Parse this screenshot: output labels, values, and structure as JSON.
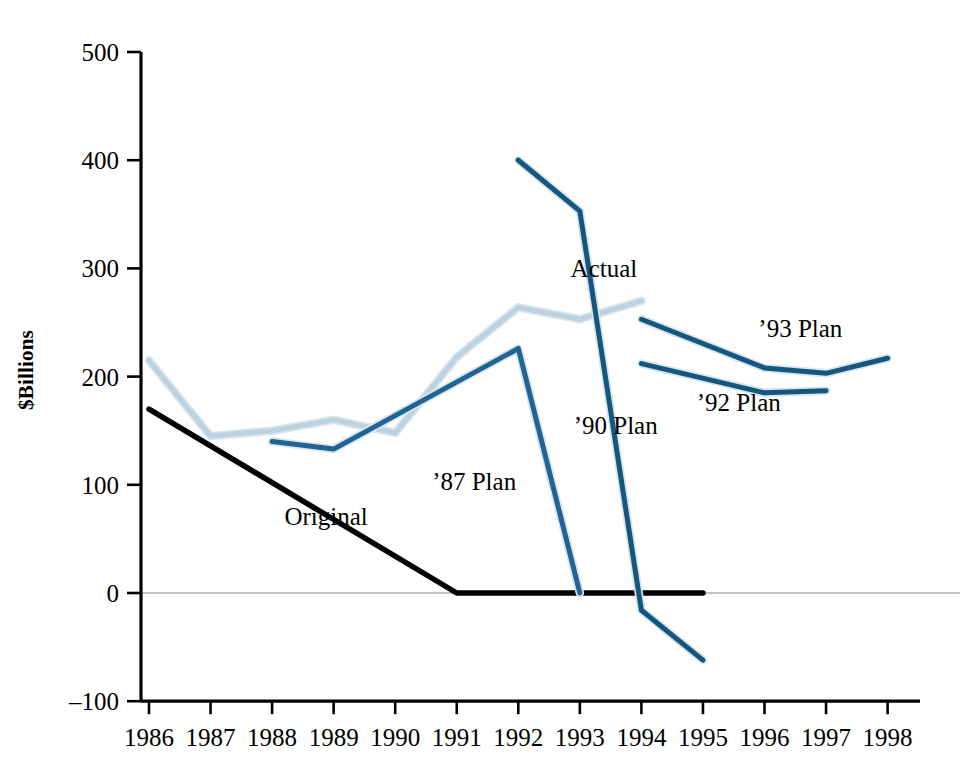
{
  "chart_data": {
    "type": "line",
    "title": "",
    "xlabel": "",
    "ylabel": "$Billions",
    "xlim": [
      1986,
      1998
    ],
    "ylim": [
      -100,
      500
    ],
    "yticks": [
      500,
      400,
      300,
      200,
      100,
      0,
      -100
    ],
    "ytick_labels": [
      "500",
      "400",
      "300",
      "200",
      "100",
      "0",
      "–100"
    ],
    "xticks": [
      1986,
      1987,
      1988,
      1989,
      1990,
      1991,
      1992,
      1993,
      1994,
      1995,
      1996,
      1997,
      1998
    ],
    "xtick_labels": [
      "1986",
      "1987",
      "1988",
      "1989",
      "1990",
      "1991",
      "1992",
      "1993",
      "1994",
      "1995",
      "1996",
      "1997",
      "1998"
    ],
    "grid": false,
    "legend_position": "inline-annotations",
    "zero_line": true,
    "series": [
      {
        "name": "Actual",
        "color": "#bcd2e0",
        "label": "Actual",
        "label_x": 1992.85,
        "label_y": 292,
        "x": [
          1986,
          1987,
          1988,
          1989,
          1990,
          1991,
          1992,
          1993,
          1994
        ],
        "y": [
          215,
          145,
          150,
          160,
          148,
          218,
          264,
          253,
          270
        ]
      },
      {
        "name": "Original",
        "color": "#000000",
        "label": "Original",
        "label_x": 1988.2,
        "label_y": 63,
        "x": [
          1986,
          1991,
          1995
        ],
        "y": [
          170,
          0,
          0
        ]
      },
      {
        "name": "'87 Plan",
        "color": "#1f6492",
        "label": "’87 Plan",
        "label_x": 1990.6,
        "label_y": 95,
        "x": [
          1988,
          1989,
          1992,
          1993
        ],
        "y": [
          140,
          133,
          226,
          0
        ]
      },
      {
        "name": "'90 Plan",
        "color": "#14577e",
        "label": "’90 Plan",
        "label_x": 1992.9,
        "label_y": 147,
        "x": [
          1992,
          1993,
          1994,
          1995
        ],
        "y": [
          400,
          353,
          -16,
          -62
        ]
      },
      {
        "name": "'92 Plan",
        "color": "#14577e",
        "label": "’92 Plan",
        "label_x": 1994.9,
        "label_y": 168,
        "x": [
          1994,
          1996,
          1997
        ],
        "y": [
          212,
          185,
          187
        ]
      },
      {
        "name": "'93 Plan",
        "color": "#14577e",
        "label": "’93 Plan",
        "label_x": 1995.9,
        "label_y": 237,
        "x": [
          1994,
          1996,
          1997,
          1998
        ],
        "y": [
          253,
          208,
          203,
          217
        ]
      }
    ]
  }
}
